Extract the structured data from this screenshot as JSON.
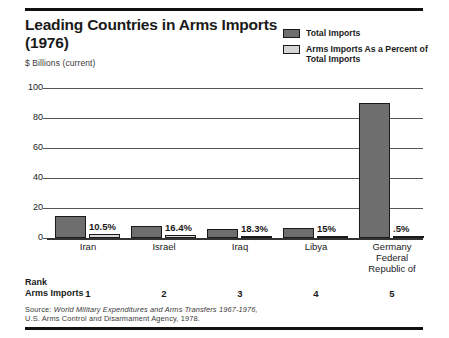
{
  "header": {
    "title": "Leading Countries in Arms Imports (1976)",
    "subtitle": "$ Billions (current)"
  },
  "legend": {
    "items": [
      {
        "label": "Total Imports",
        "swatch": "dark",
        "color": "#6e6e6e"
      },
      {
        "label": "Arms Imports As a Percent of Total Imports",
        "swatch": "light",
        "color": "#d4d4d4"
      }
    ]
  },
  "rank": {
    "line1": "Rank",
    "line2": "Arms Imports",
    "values": [
      "1",
      "2",
      "3",
      "4",
      "5"
    ]
  },
  "source": {
    "prefix": "Source:",
    "italic": "World Military Expenditures and Arms Transfers 1967-1976,",
    "rest": "U.S. Arms Control and Disarmament Agency, 1978."
  },
  "chart_data": {
    "type": "bar",
    "title": "Leading Countries in Arms Imports (1976)",
    "xlabel": "",
    "ylabel": "$ Billions (current)",
    "ylim": [
      0,
      100
    ],
    "yticks": [
      "0",
      "20",
      "40",
      "60",
      "80",
      "100"
    ],
    "grid": true,
    "legend_position": "top-right",
    "categories": [
      "Iran",
      "Israel",
      "Iraq",
      "Libya",
      "Germany Federal Republic of"
    ],
    "category_lines": [
      [
        "Iran"
      ],
      [
        "Israel"
      ],
      [
        "Iraq"
      ],
      [
        "Libya"
      ],
      [
        "Germany",
        "Federal",
        "Republic of"
      ]
    ],
    "series": [
      {
        "name": "Total Imports",
        "values": [
          15,
          8,
          6,
          7,
          90
        ]
      },
      {
        "name": "Arms Imports As a Percent of Total Imports",
        "values": [
          2.5,
          1.8,
          1.6,
          1.6,
          0.5
        ]
      }
    ],
    "percent_labels": [
      "10.5%",
      "16.4%",
      "18.3%",
      "15%",
      ".5%"
    ]
  }
}
